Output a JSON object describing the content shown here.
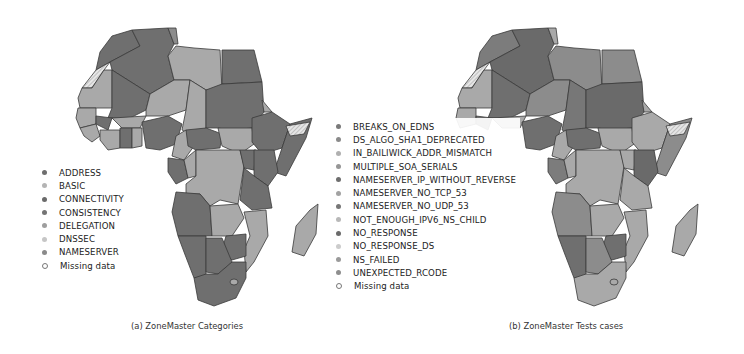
{
  "figure": {
    "panels": [
      {
        "id": "a",
        "caption": "(a) ZoneMaster Categories",
        "legend": [
          {
            "label": "ADDRESS",
            "color": "#6e6e6e"
          },
          {
            "label": "BASIC",
            "color": "#b4b4b4"
          },
          {
            "label": "CONNECTIVITY",
            "color": "#6a6a6a"
          },
          {
            "label": "CONSISTENCY",
            "color": "#747474"
          },
          {
            "label": "DELEGATION",
            "color": "#9e9e9e"
          },
          {
            "label": "DNSSEC",
            "color": "#c6c6c6"
          },
          {
            "label": "NAMESERVER",
            "color": "#8a8a8a"
          },
          {
            "label": "Missing data",
            "color": "#ffffff",
            "missing": true
          }
        ]
      },
      {
        "id": "b",
        "caption": "(b) ZoneMaster Tests cases",
        "legend": [
          {
            "label": "BREAKS_ON_EDNS",
            "color": "#7a7a7a"
          },
          {
            "label": "DS_ALGO_SHA1_DEPRECATED",
            "color": "#8a8a8a"
          },
          {
            "label": "IN_BAILIWICK_ADDR_MISMATCH",
            "color": "#b0b0b0"
          },
          {
            "label": "MULTIPLE_SOA_SERIALS",
            "color": "#969696"
          },
          {
            "label": "NAMESERVER_IP_WITHOUT_REVERSE",
            "color": "#6e6e6e"
          },
          {
            "label": "NAMESERVER_NO_TCP_53",
            "color": "#a2a2a2"
          },
          {
            "label": "NAMESERVER_NO_UDP_53",
            "color": "#777777"
          },
          {
            "label": "NOT_ENOUGH_IPV6_NS_CHILD",
            "color": "#b8b8b8"
          },
          {
            "label": "NO_RESPONSE",
            "color": "#6a6a6a"
          },
          {
            "label": "NO_RESPONSE_DS",
            "color": "#cccccc"
          },
          {
            "label": "NS_FAILED",
            "color": "#9a9a9a"
          },
          {
            "label": "UNEXPECTED_RCODE",
            "color": "#8e8e8e"
          },
          {
            "label": "Missing data",
            "color": "#ffffff",
            "missing": true
          }
        ]
      }
    ],
    "colors": {
      "dark_fill": "#6f6f6f",
      "mid_fill": "#8c8c8c",
      "light_fill": "#a9a9a9",
      "border": "#3a3a3a"
    }
  }
}
